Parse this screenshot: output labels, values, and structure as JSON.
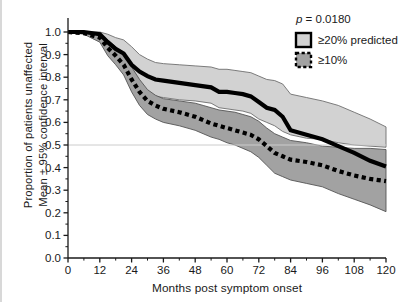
{
  "chart_data": {
    "type": "line",
    "title": "",
    "xlabel": "Months post symptom onset",
    "ylabel": "Proportion of patients unaffected\nMean ± 95% confidence interval",
    "ylabel_line1": "Proportion of patients unaffected",
    "ylabel_line2": "Mean ± 95% confidence interval",
    "xlim": [
      0,
      120
    ],
    "ylim": [
      0.0,
      1.0
    ],
    "xticks": [
      0,
      12,
      24,
      36,
      48,
      60,
      72,
      84,
      96,
      108,
      120
    ],
    "xtick_labels": [
      "0",
      "12",
      "24",
      "36",
      "48",
      "60",
      "72",
      "84",
      "96",
      "108",
      "120"
    ],
    "yticks": [
      0.0,
      0.1,
      0.2,
      0.3,
      0.4,
      0.5,
      0.6,
      0.7,
      0.8,
      0.9,
      1.0
    ],
    "ytick_labels": [
      "0.0",
      "0.1",
      "0.2",
      "0.3",
      "0.4",
      "0.5",
      "0.6",
      "0.7",
      "0.8",
      "0.9",
      "1.0"
    ],
    "grid": false,
    "reference_line_y": 0.5,
    "legend_position": "top-right",
    "annotations": [
      {
        "name": "p-value",
        "text": "p = 0.0180",
        "italic_prefix": "p",
        "rest": " = 0.0180"
      }
    ],
    "series": [
      {
        "name": "≥20% predicted",
        "style": "solid",
        "line_color": "#000000",
        "line_width": 4.2,
        "band_color": "#d2d2d2",
        "band_edge_color": "#6e6e6e",
        "x": [
          0,
          6,
          12,
          15,
          18,
          21,
          24,
          27,
          30,
          33,
          36,
          42,
          48,
          54,
          57,
          60,
          63,
          66,
          69,
          72,
          75,
          78,
          81,
          84,
          90,
          96,
          102,
          108,
          114,
          120
        ],
        "mean": [
          1.0,
          1.0,
          0.99,
          0.955,
          0.925,
          0.905,
          0.855,
          0.825,
          0.805,
          0.79,
          0.785,
          0.775,
          0.765,
          0.755,
          0.735,
          0.735,
          0.73,
          0.725,
          0.715,
          0.69,
          0.665,
          0.655,
          0.625,
          0.565,
          0.545,
          0.525,
          0.495,
          0.465,
          0.43,
          0.405
        ],
        "upper": [
          1.0,
          1.0,
          1.0,
          0.99,
          0.975,
          0.965,
          0.935,
          0.9,
          0.88,
          0.865,
          0.86,
          0.855,
          0.85,
          0.845,
          0.835,
          0.835,
          0.83,
          0.825,
          0.82,
          0.805,
          0.79,
          0.785,
          0.77,
          0.725,
          0.71,
          0.695,
          0.675,
          0.645,
          0.615,
          0.58
        ],
        "lower": [
          1.0,
          0.995,
          0.97,
          0.915,
          0.875,
          0.845,
          0.775,
          0.745,
          0.725,
          0.715,
          0.71,
          0.7,
          0.695,
          0.685,
          0.665,
          0.66,
          0.655,
          0.65,
          0.64,
          0.615,
          0.6,
          0.585,
          0.56,
          0.545,
          0.53,
          0.525,
          0.51,
          0.5,
          0.495,
          0.49
        ]
      },
      {
        "name": "≥10%",
        "style": "dotted",
        "line_color": "#000000",
        "line_width": 4.2,
        "band_color": "#a2a2a2",
        "band_edge_color": "#555555",
        "x": [
          0,
          6,
          12,
          15,
          18,
          21,
          24,
          27,
          30,
          33,
          36,
          42,
          48,
          51,
          54,
          57,
          60,
          63,
          66,
          69,
          72,
          75,
          78,
          81,
          84,
          90,
          96,
          102,
          108,
          114,
          120
        ],
        "mean": [
          1.0,
          0.995,
          0.975,
          0.93,
          0.895,
          0.855,
          0.79,
          0.735,
          0.695,
          0.675,
          0.66,
          0.645,
          0.625,
          0.61,
          0.595,
          0.585,
          0.575,
          0.565,
          0.555,
          0.545,
          0.525,
          0.495,
          0.465,
          0.45,
          0.435,
          0.425,
          0.41,
          0.385,
          0.365,
          0.35,
          0.34
        ],
        "upper": [
          1.0,
          1.0,
          0.995,
          0.965,
          0.935,
          0.9,
          0.845,
          0.79,
          0.745,
          0.72,
          0.705,
          0.695,
          0.685,
          0.675,
          0.665,
          0.655,
          0.65,
          0.645,
          0.635,
          0.625,
          0.605,
          0.575,
          0.55,
          0.535,
          0.52,
          0.51,
          0.495,
          0.49,
          0.485,
          0.485,
          0.48
        ],
        "lower": [
          1.0,
          0.99,
          0.955,
          0.895,
          0.855,
          0.81,
          0.735,
          0.675,
          0.635,
          0.615,
          0.6,
          0.585,
          0.565,
          0.55,
          0.535,
          0.525,
          0.51,
          0.5,
          0.485,
          0.47,
          0.445,
          0.41,
          0.375,
          0.36,
          0.345,
          0.33,
          0.315,
          0.285,
          0.26,
          0.235,
          0.205
        ]
      }
    ],
    "legend": [
      {
        "label": "≥20% predicted",
        "swatch_fill": "#d2d2d2",
        "swatch_border": "#000000",
        "swatch_style": "solid"
      },
      {
        "label": "≥10%",
        "swatch_fill": "#a2a2a2",
        "swatch_border": "#000000",
        "swatch_style": "dashed"
      }
    ]
  }
}
